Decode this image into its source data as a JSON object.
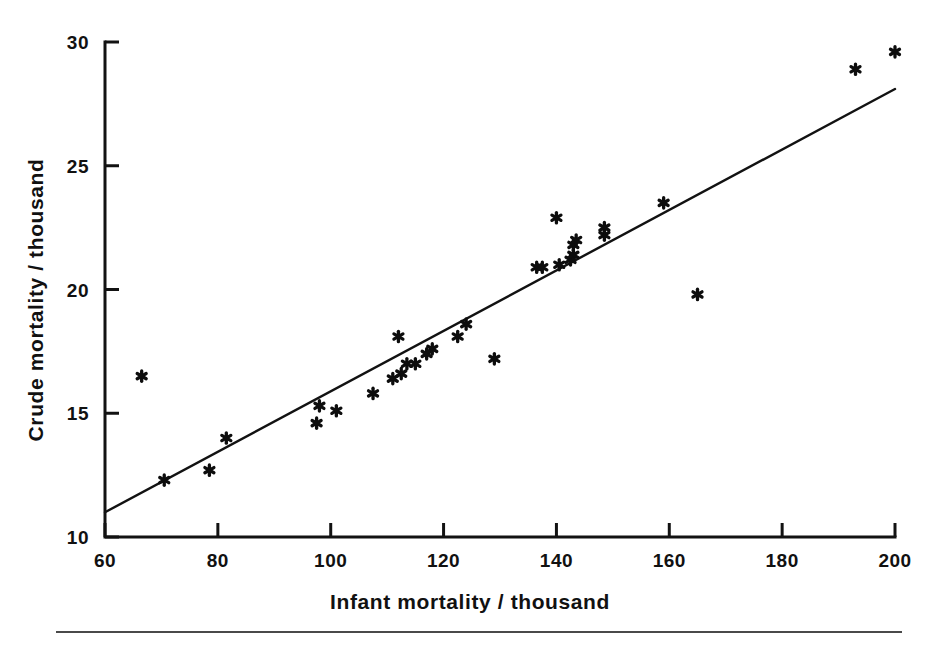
{
  "chart_data": {
    "type": "scatter",
    "title": "",
    "xlabel": "Infant mortality / thousand",
    "ylabel": "Crude mortality / thousand",
    "xlim": [
      60,
      200
    ],
    "ylim": [
      10,
      30
    ],
    "xticks": [
      60,
      80,
      100,
      120,
      140,
      160,
      180,
      200
    ],
    "yticks": [
      10,
      15,
      20,
      25,
      30
    ],
    "xtick_labels": [
      "60",
      "80",
      "100",
      "120",
      "140",
      "160",
      "180",
      "200"
    ],
    "ytick_labels": [
      "10",
      "15",
      "20",
      "25",
      "30"
    ],
    "grid": false,
    "legend": null,
    "marker": "asterisk",
    "marker_color": "#0d0d0d",
    "points": [
      {
        "x": 66.5,
        "y": 16.5
      },
      {
        "x": 70.5,
        "y": 12.3
      },
      {
        "x": 78.5,
        "y": 12.7
      },
      {
        "x": 81.5,
        "y": 14.0
      },
      {
        "x": 97.5,
        "y": 14.6
      },
      {
        "x": 98.0,
        "y": 15.3
      },
      {
        "x": 101.0,
        "y": 15.1
      },
      {
        "x": 107.5,
        "y": 15.8
      },
      {
        "x": 111.0,
        "y": 16.4
      },
      {
        "x": 112.0,
        "y": 18.1
      },
      {
        "x": 112.5,
        "y": 16.6
      },
      {
        "x": 113.5,
        "y": 17.0
      },
      {
        "x": 115.0,
        "y": 17.0
      },
      {
        "x": 117.0,
        "y": 17.4
      },
      {
        "x": 118.0,
        "y": 17.6
      },
      {
        "x": 122.5,
        "y": 18.1
      },
      {
        "x": 124.0,
        "y": 18.6
      },
      {
        "x": 129.0,
        "y": 17.2
      },
      {
        "x": 136.5,
        "y": 20.9
      },
      {
        "x": 137.5,
        "y": 20.9
      },
      {
        "x": 140.0,
        "y": 22.9
      },
      {
        "x": 140.5,
        "y": 21.0
      },
      {
        "x": 142.5,
        "y": 21.2
      },
      {
        "x": 143.0,
        "y": 21.4
      },
      {
        "x": 143.0,
        "y": 21.8
      },
      {
        "x": 143.5,
        "y": 22.0
      },
      {
        "x": 148.5,
        "y": 22.2
      },
      {
        "x": 148.5,
        "y": 22.5
      },
      {
        "x": 159.0,
        "y": 23.5
      },
      {
        "x": 165.0,
        "y": 19.8
      },
      {
        "x": 193.0,
        "y": 28.9
      },
      {
        "x": 200.0,
        "y": 29.6
      }
    ],
    "fit_line": {
      "label": "regression line",
      "x_start": 60,
      "y_start": 11.0,
      "x_end": 200,
      "y_end": 28.1
    }
  }
}
